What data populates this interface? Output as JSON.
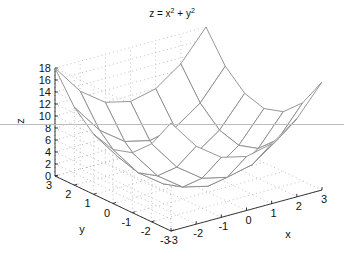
{
  "chart_data": {
    "type": "surface",
    "title_parts": {
      "lhs": "z = x",
      "exp1": "2",
      "mid": " + y",
      "exp2": "2"
    },
    "xlabel": "x",
    "ylabel": "y",
    "zlabel": "z",
    "x": [
      -3,
      -2,
      -1,
      0,
      1,
      2,
      3
    ],
    "y": [
      -3,
      -2,
      -1,
      0,
      1,
      2,
      3
    ],
    "z": [
      [
        18,
        13,
        10,
        9,
        10,
        13,
        18
      ],
      [
        13,
        8,
        5,
        4,
        5,
        8,
        13
      ],
      [
        10,
        5,
        2,
        1,
        2,
        5,
        10
      ],
      [
        9,
        4,
        1,
        0,
        1,
        4,
        9
      ],
      [
        10,
        5,
        2,
        1,
        2,
        5,
        10
      ],
      [
        13,
        8,
        5,
        4,
        5,
        8,
        13
      ],
      [
        18,
        13,
        10,
        9,
        10,
        13,
        18
      ]
    ],
    "xlim": [
      -3,
      3
    ],
    "ylim": [
      -3,
      3
    ],
    "zlim": [
      0,
      18
    ],
    "xticks": [
      -3,
      -2,
      -1,
      0,
      1,
      2,
      3
    ],
    "yticks": [
      -3,
      -2,
      -1,
      0,
      1,
      2,
      3
    ],
    "zticks": [
      0,
      2,
      4,
      6,
      8,
      10,
      12,
      14,
      16,
      18
    ],
    "grid": true,
    "mesh_color": "#8a8a8a",
    "face_color": "#ffffff",
    "grid_color": "#b0b0b0",
    "axis_color": "#222222"
  }
}
